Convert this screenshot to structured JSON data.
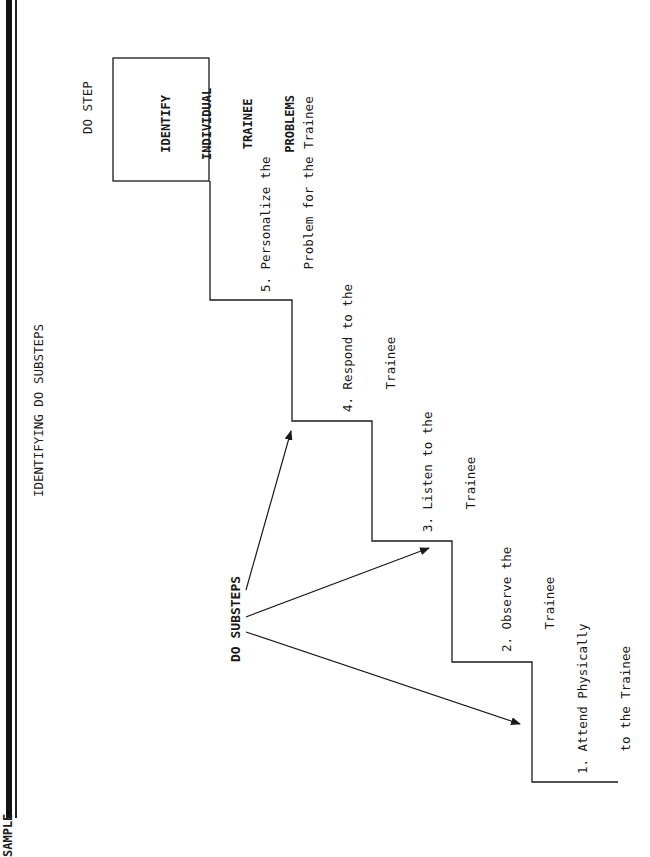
{
  "sidebar": {
    "label": "SAMPLE"
  },
  "title": "IDENTIFYING DO SUBSTEPS",
  "do_step": {
    "label": "DO STEP",
    "box_lines": [
      "IDENTIFY",
      "INDIVIDUAL",
      "TRAINEE",
      "PROBLEMS"
    ]
  },
  "substeps_label": "DO SUBSTEPS",
  "substeps": [
    {
      "number": "1.",
      "line1": "1. Attend Physically",
      "line2": "   to the Trainee"
    },
    {
      "number": "2.",
      "line1": "2. Observe the",
      "line2": "   Trainee"
    },
    {
      "number": "3.",
      "line1": "3. Listen to the",
      "line2": "   Trainee"
    },
    {
      "number": "4.",
      "line1": "4. Respond to the",
      "line2": "   Trainee"
    },
    {
      "number": "5.",
      "line1": "5. Personalize the",
      "line2": "   Problem for the Trainee"
    }
  ],
  "colors": {
    "ink": "#1a1a1a",
    "background": "#ffffff"
  }
}
